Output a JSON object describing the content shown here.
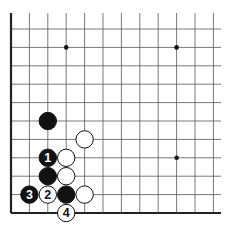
{
  "diagram": {
    "type": "go-board-fragment",
    "background": "#ffffff",
    "line_color": "#555555",
    "edge_color": "#222222",
    "grid": {
      "origin_x": 11,
      "origin_y": 29,
      "spacing": 18.4,
      "columns": 12,
      "rows": 11,
      "left_edge": true,
      "bottom_edge": true
    },
    "star_points": [
      {
        "col": 3,
        "row": 1
      },
      {
        "col": 9,
        "row": 1
      },
      {
        "col": 9,
        "row": 7
      }
    ],
    "stones": [
      {
        "color": "black",
        "col": 2,
        "row": 5,
        "label": ""
      },
      {
        "color": "white",
        "col": 4,
        "row": 6,
        "label": ""
      },
      {
        "color": "black",
        "col": 2,
        "row": 7,
        "label": "1"
      },
      {
        "color": "white",
        "col": 3,
        "row": 7,
        "label": ""
      },
      {
        "color": "black",
        "col": 2,
        "row": 8,
        "label": ""
      },
      {
        "color": "white",
        "col": 3,
        "row": 8,
        "label": ""
      },
      {
        "color": "black",
        "col": 1,
        "row": 9,
        "label": "3"
      },
      {
        "color": "white",
        "col": 2,
        "row": 9,
        "label": "2"
      },
      {
        "color": "black",
        "col": 3,
        "row": 9,
        "label": ""
      },
      {
        "color": "white",
        "col": 4,
        "row": 9,
        "label": ""
      },
      {
        "color": "white",
        "col": 3,
        "row": 10,
        "label": "4"
      }
    ]
  }
}
